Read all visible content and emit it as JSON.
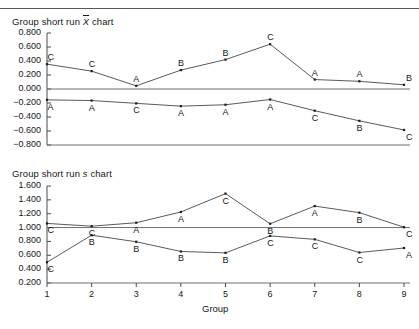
{
  "figure": {
    "xlabel": "Group",
    "x_categories": [
      "1",
      "2",
      "3",
      "4",
      "5",
      "6",
      "7",
      "8",
      "9"
    ]
  },
  "charts": [
    {
      "id": "xbar-chart",
      "title_prefix": "Group short run ",
      "title_symbol": "X",
      "title_suffix": " chart",
      "ytick_labels": [
        "0.800",
        "0.600",
        "0.400",
        "0.200",
        "0.000",
        "−0.200",
        "−0.400",
        "−0.600",
        "−0.800"
      ]
    },
    {
      "id": "s-chart",
      "title_prefix": "Group short run ",
      "title_symbol": "s",
      "title_suffix": " chart",
      "ytick_labels": [
        "1.600",
        "1.400",
        "1.200",
        "1.000",
        "0.800",
        "0.600",
        "0.400",
        "0.200"
      ]
    }
  ],
  "chart_data": [
    {
      "type": "line",
      "title": "Group short run X̄ chart",
      "xlabel": "",
      "ylabel": "",
      "x": [
        1,
        2,
        3,
        4,
        5,
        6,
        7,
        8,
        9
      ],
      "ylim": [
        -0.8,
        0.8
      ],
      "yticks": [
        0.8,
        0.6,
        0.4,
        0.2,
        0.0,
        -0.2,
        -0.4,
        -0.6,
        -0.8
      ],
      "grid": false,
      "legend": "none",
      "series": [
        {
          "name": "upper-series",
          "values": [
            0.355,
            0.255,
            0.045,
            0.27,
            0.42,
            0.64,
            0.135,
            0.11,
            0.06
          ],
          "point_labels": [
            "C",
            "C",
            "A",
            "B",
            "B",
            "C",
            "A",
            "A",
            "B"
          ]
        },
        {
          "name": "lower-series",
          "values": [
            -0.155,
            -0.165,
            -0.205,
            -0.245,
            -0.225,
            -0.15,
            -0.31,
            -0.455,
            -0.585
          ],
          "point_labels": [
            "A",
            "A",
            "C",
            "A",
            "A",
            "A",
            "C",
            "B",
            "C"
          ]
        }
      ]
    },
    {
      "type": "line",
      "title": "Group short run s chart",
      "xlabel": "Group",
      "ylabel": "",
      "x": [
        1,
        2,
        3,
        4,
        5,
        6,
        7,
        8,
        9
      ],
      "ylim": [
        0.2,
        1.6
      ],
      "yticks": [
        1.6,
        1.4,
        1.2,
        1.0,
        0.8,
        0.6,
        0.4,
        0.2
      ],
      "grid": false,
      "legend": "none",
      "series": [
        {
          "name": "upper-series",
          "values": [
            1.06,
            1.02,
            1.07,
            1.225,
            1.49,
            1.055,
            1.31,
            1.215,
            1.005
          ],
          "point_labels": [
            "C",
            "C",
            "A",
            "A",
            "C",
            "B",
            "A",
            "B",
            "C"
          ]
        },
        {
          "name": "lower-series",
          "values": [
            0.5,
            0.89,
            0.795,
            0.655,
            0.635,
            0.88,
            0.83,
            0.64,
            0.705
          ],
          "point_labels": [
            "C",
            "B",
            "B",
            "B",
            "B",
            "C",
            "C",
            "C",
            "A"
          ]
        }
      ]
    }
  ]
}
